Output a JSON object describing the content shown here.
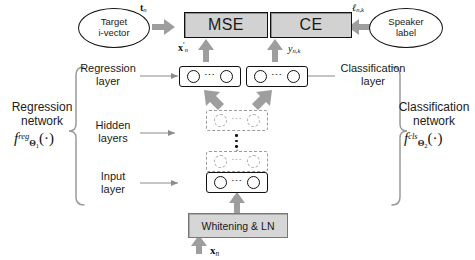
{
  "figure": {
    "colors": {
      "loss_box_fill": "#d2d2d2",
      "whitening_fill": "#d6d6d6",
      "arrow_gray": "#9e9e9e",
      "dashed_gray": "#9a9a9a",
      "stroke": "#111111"
    }
  },
  "inputs": {
    "target_ivector": "Target\ni-vector",
    "target_ivector_line1": "Target",
    "target_ivector_line2": "i-vector",
    "speaker_label_line1": "Speaker",
    "speaker_label_line2": "label"
  },
  "losses": {
    "regression_loss": "MSE",
    "classification_loss": "CE"
  },
  "math": {
    "target_vector": "t_n",
    "speaker_label_symbol": "ℓ_{n,k}",
    "regression_output": "x'_n",
    "classification_output": "y_{n,k}",
    "network_input": "x_n"
  },
  "layers": {
    "regression_layer_line1": "Regression",
    "regression_layer_line2": "layer",
    "classification_layer_line1": "Classification",
    "classification_layer_line2": "layer",
    "hidden_layers_line1": "Hidden",
    "hidden_layers_line2": "layers",
    "input_layer_line1": "Input",
    "input_layer_line2": "layer",
    "whitening": "Whitening & LN"
  },
  "networks": {
    "regression_line1": "Regression",
    "regression_line2": "network",
    "regression_formula": "f^{reg}_{Θ3₁}(·)",
    "classification_line1": "Classification",
    "classification_line2": "network",
    "classification_formula": "f^{cls}_{Θ₂}(·)"
  }
}
